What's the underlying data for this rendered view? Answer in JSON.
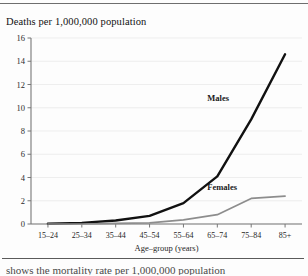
{
  "document": {
    "clipped_footer_text": "shows the mortality rate per 1,000,000 population"
  },
  "chart_data": {
    "type": "line",
    "title": "Deaths per 1,000,000 population",
    "xlabel": "Age–group (years)",
    "ylabel": "",
    "categories": [
      "15–24",
      "25–34",
      "35–44",
      "45–54",
      "55–64",
      "65–74",
      "75–84",
      "85+"
    ],
    "ylim": [
      0,
      16
    ],
    "yticks": [
      0,
      2,
      4,
      6,
      8,
      10,
      12,
      14,
      16
    ],
    "ytick_labels": [
      "0",
      "2",
      "4",
      "6",
      "8",
      "10",
      "12",
      "14",
      "16"
    ],
    "grid": true,
    "legend_position": "inline-annotations",
    "series": [
      {
        "name": "Males",
        "color": "#111111",
        "values": [
          0.02,
          0.1,
          0.3,
          0.7,
          1.8,
          4.1,
          9.0,
          14.6
        ]
      },
      {
        "name": "Females",
        "color": "#8d8d8d",
        "values": [
          0.0,
          0.0,
          0.05,
          0.1,
          0.35,
          0.8,
          2.2,
          2.4
        ]
      }
    ],
    "annotations": [
      {
        "text": "Males",
        "category": "65–74",
        "value": 10.6
      },
      {
        "text": "Females",
        "category": "65–74",
        "value": 2.9
      }
    ]
  }
}
